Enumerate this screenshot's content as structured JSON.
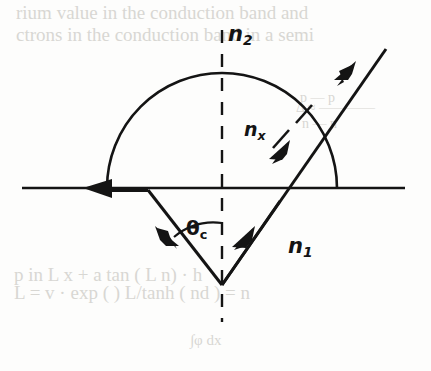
{
  "figure": {
    "name": "critical-angle-total-internal-reflection-diagram",
    "background_color": "#fdfdfc",
    "ink_color": "#141414",
    "ghost_color": "#d8d7d3",
    "labels": {
      "n2": {
        "base": "n",
        "sub": "2",
        "x": 228,
        "y": 22
      },
      "n1": {
        "base": "n",
        "sub": "1",
        "x": 288,
        "y": 234
      },
      "nx": {
        "base": "n",
        "sub": "x",
        "x": 244,
        "y": 118
      },
      "theta_c": {
        "base": "θ",
        "sub": "c",
        "x": 186,
        "y": 216
      }
    },
    "geometry": {
      "interface_line": {
        "x1": 22,
        "y1": 188,
        "x2": 405,
        "y2": 188
      },
      "normal_dashed_line": {
        "x": 222,
        "y1": 30,
        "y2": 322
      },
      "semicircle": {
        "cx": 222,
        "cy": 188,
        "r": 115
      },
      "refracted_grazing_ray": {
        "x1": 147,
        "y1": 188,
        "x2": 85,
        "y2": 188,
        "direction": "left"
      },
      "incident_ray": {
        "x1": 222,
        "y1": 285,
        "x2": 152,
        "y2": 196,
        "direction": "up-left"
      },
      "reflected_ray": {
        "x1": 222,
        "y1": 285,
        "x2": 385,
        "y2": 50,
        "direction": "up-right"
      },
      "leader_dashes": [
        {
          "x1": 276,
          "y1": 143,
          "x2": 290,
          "y2": 128
        },
        {
          "x1": 296,
          "y1": 122,
          "x2": 310,
          "y2": 107
        }
      ],
      "angle_arc": {
        "cx": 222,
        "cy": 285,
        "r": 62,
        "from_deg": 232,
        "to_deg": 270
      }
    }
  },
  "ghost_text": {
    "description": "faint show-through text from reverse side of scanned page",
    "lines": [
      {
        "text": "rium value in the conduction band and",
        "x": 16,
        "y": 2,
        "size": 19
      },
      {
        "text": "ctrons in the conduction band in a semi",
        "x": 16,
        "y": 24,
        "size": 19
      },
      {
        "text": "p — p",
        "x": 300,
        "y": 90,
        "size": 14
      },
      {
        "text": "Δ ≈ ————",
        "x": 296,
        "y": 100,
        "size": 14
      },
      {
        "text": "n — n",
        "x": 302,
        "y": 116,
        "size": 14
      },
      {
        "text": "p in L x + a tan ( L n) · h",
        "x": 14,
        "y": 264,
        "size": 19
      },
      {
        "text": "L = v · exp ( ) L/tanh ( nd ) = n",
        "x": 14,
        "y": 282,
        "size": 19
      },
      {
        "text": "∫φ dx",
        "x": 190,
        "y": 332,
        "size": 15
      }
    ]
  }
}
